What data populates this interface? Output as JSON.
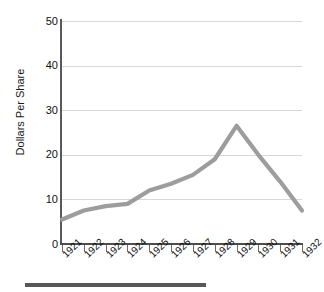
{
  "chart_data": {
    "type": "line",
    "title": "",
    "subtitle": "",
    "xlabel": "",
    "ylabel": "Dollars Per Share",
    "categories": [
      "1921",
      "1922",
      "1923",
      "1924",
      "1925",
      "1926",
      "1927",
      "1928",
      "1929",
      "1930",
      "1931",
      "1932"
    ],
    "values": [
      5.5,
      7.5,
      8.5,
      9.0,
      12.0,
      13.5,
      15.5,
      19.0,
      26.5,
      20.0,
      14.0,
      7.5
    ],
    "series": [
      {
        "name": "Dollars Per Share",
        "values": [
          5.5,
          7.5,
          8.5,
          9.0,
          12.0,
          13.5,
          15.5,
          19.0,
          26.5,
          20.0,
          14.0,
          7.5
        ],
        "color": "#9d9d9d"
      }
    ],
    "ylim": [
      0,
      50
    ],
    "yticks": [
      0,
      10,
      20,
      30,
      40,
      50
    ],
    "ytick_labels": [
      "0",
      "10",
      "20",
      "30",
      "40",
      "50"
    ],
    "xtick_labels": [
      "1921",
      "1922",
      "1923",
      "1924",
      "1925",
      "1926",
      "1927",
      "1928",
      "1929",
      "1930",
      "1931",
      "1932"
    ],
    "grid": "horizontal",
    "grid_color": "#d8d8d8",
    "legend": "none",
    "axis_color": "#4d4d4f",
    "annotations": []
  },
  "figure": {
    "footer_rule_color": "#58585a",
    "background": "#ffffff"
  }
}
